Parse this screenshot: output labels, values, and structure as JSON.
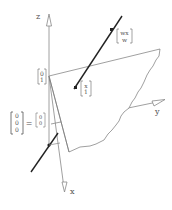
{
  "diagram": {
    "type": "3d-projective-plane-diagram",
    "axes": [
      {
        "name": "z",
        "label": "z"
      },
      {
        "name": "y",
        "label": "y"
      },
      {
        "name": "x",
        "label": "x"
      }
    ],
    "labels": {
      "top_vector": {
        "top": "wx",
        "bottom": "w"
      },
      "mid_vector": {
        "top": "x",
        "bottom": "1"
      },
      "z_vector": {
        "top": "0",
        "bottom": "1"
      },
      "origin_left": [
        "0",
        "0",
        "0"
      ],
      "equals": "=",
      "origin_right": {
        "top": "0",
        "bottom": "0"
      }
    },
    "colors": {
      "stroke": "#777777",
      "line": "#222222",
      "text": "#555555"
    }
  }
}
